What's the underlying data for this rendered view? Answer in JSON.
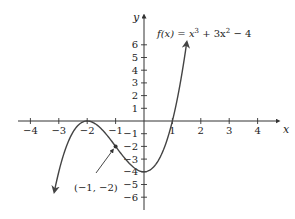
{
  "chart_data": {
    "type": "line",
    "function": "x^3 + 3x^2 - 4",
    "xlabel": "x",
    "ylabel": "y",
    "xlim": [
      -4.5,
      4.9
    ],
    "ylim": [
      -7,
      7.5
    ],
    "x_ticks": [
      -4,
      -3,
      -2,
      -1,
      1,
      2,
      3,
      4
    ],
    "y_ticks": [
      6,
      5,
      4,
      3,
      2,
      1,
      -1,
      -2,
      -3,
      -4,
      -5,
      -6
    ],
    "x_tick_labels": [
      "−4",
      "−3",
      "−2",
      "−1",
      "1",
      "2",
      "3",
      "4"
    ],
    "y_tick_labels": [
      "6",
      "5",
      "4",
      "3",
      "2",
      "1",
      "−1",
      "−2",
      "−3",
      "−4",
      "−5",
      "−6"
    ],
    "grid": false,
    "legend": null,
    "domain_drawn": [
      -3.15,
      1.5
    ],
    "key_points": [
      {
        "x": -2,
        "y": 0,
        "label": "local max / root"
      },
      {
        "x": 0,
        "y": -4,
        "label": "local min"
      },
      {
        "x": 1,
        "y": 0,
        "label": "root"
      },
      {
        "x": -1,
        "y": -2,
        "label": "inflection point"
      }
    ],
    "annotations": [
      {
        "text": "(−1, −2)",
        "x": -1,
        "y": -2,
        "arrow": true
      }
    ],
    "series": [
      {
        "name": "f(x) = x³ + 3x² − 4",
        "color": "#444444",
        "arrows_at_ends": true
      }
    ]
  },
  "labels": {
    "title_prefix": "f(x) = x",
    "title_sup1": "3",
    "title_mid": " + 3x",
    "title_sup2": "2",
    "title_suffix": " − 4",
    "x_axis": "x",
    "y_axis": "y",
    "annotation": "(−1, −2)"
  },
  "colors": {
    "axis": "#333333",
    "curve": "#444444",
    "text": "#222222",
    "background": "#ffffff"
  }
}
